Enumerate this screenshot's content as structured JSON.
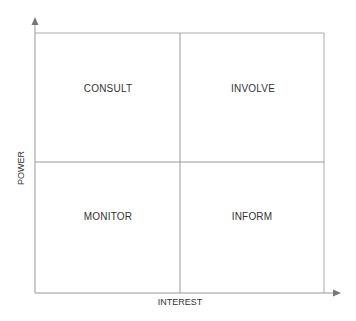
{
  "diagram": {
    "x_axis_label": "INTEREST",
    "y_axis_label": "POWER",
    "quadrants": {
      "top_left": "CONSULT",
      "top_right": "INVOLVE",
      "bottom_left": "MONITOR",
      "bottom_right": "INFORM"
    },
    "colors": {
      "line": "#999999",
      "text": "#333333",
      "arrow": "#777777"
    }
  }
}
